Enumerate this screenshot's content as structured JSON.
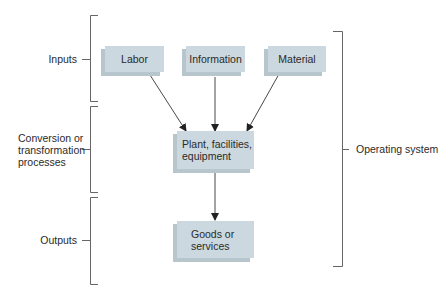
{
  "diagram": {
    "stages": [
      {
        "id": "inputs",
        "label": "Inputs"
      },
      {
        "id": "conversion",
        "label_lines": [
          "Conversion or",
          "transformation",
          "processes"
        ]
      },
      {
        "id": "outputs",
        "label": "Outputs"
      }
    ],
    "system_label": "Operating system",
    "nodes": {
      "labor": {
        "label": "Labor"
      },
      "information": {
        "label": "Information"
      },
      "material": {
        "label": "Material"
      },
      "plant": {
        "label_lines": [
          "Plant, facilities,",
          "equipment"
        ]
      },
      "goods": {
        "label_lines": [
          "Goods or",
          "services"
        ]
      }
    },
    "edges": [
      {
        "from": "labor",
        "to": "plant"
      },
      {
        "from": "information",
        "to": "plant"
      },
      {
        "from": "material",
        "to": "plant"
      },
      {
        "from": "plant",
        "to": "goods"
      }
    ],
    "colors": {
      "box_front": "#cbd8df",
      "box_shadow": "#b7c5cd",
      "line": "#555555",
      "text": "#2a2a2a"
    }
  }
}
